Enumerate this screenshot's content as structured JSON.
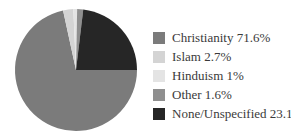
{
  "chart_data": {
    "type": "pie",
    "title": "",
    "categories": [
      "Christianity",
      "Islam",
      "Hinduism",
      "Other",
      "None/Unspecified"
    ],
    "values": [
      71.6,
      2.7,
      1,
      1.6,
      23.1
    ],
    "labels": [
      "Christianity 71.6%",
      "Islam 2.7%",
      "Hinduism 1%",
      "Other 1.6%",
      "None/Unspecified 23.1%"
    ],
    "colors": [
      "#7b7b7b",
      "#d4d4d4",
      "#e4e4e4",
      "#8f8f8f",
      "#262626"
    ],
    "start_angle_deg_from_12_clockwise": 90,
    "direction": "clockwise",
    "legend_position": "right",
    "text_color": "#3a3a3a",
    "background": "#ffffff"
  }
}
